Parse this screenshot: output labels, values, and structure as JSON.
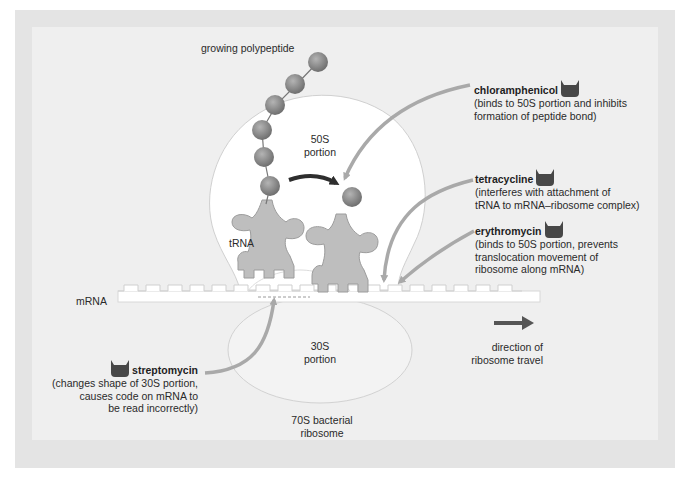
{
  "colors": {
    "frame_outer": "#e4e4e4",
    "frame_inner": "#efefef",
    "ribosome_fill": "#ffffff",
    "ribosome_outline": "#cfcfcf",
    "trna_fill": "#bdbdbd",
    "bead_fill": "#8a8a8a",
    "pointer_arrow": "#a9a9a9",
    "curved_arrow": "#2e2e2e",
    "direction_arrow": "#555555",
    "drug_icon": "#474747"
  },
  "labels": {
    "growing_polypeptide": "growing polypeptide",
    "portion_50s_line1": "50S",
    "portion_50s_line2": "portion",
    "trna": "tRNA",
    "mrna": "mRNA",
    "portion_30s_line1": "30S",
    "portion_30s_line2": "portion",
    "ribosome_line1": "70S bacterial",
    "ribosome_line2": "ribosome",
    "direction_line1": "direction of",
    "direction_line2": "ribosome travel"
  },
  "antibiotics": [
    {
      "name": "chloramphenicol",
      "icon": "antibiotic-cup-icon",
      "desc_line1": "(binds to 50S portion and inhibits",
      "desc_line2": "formation of peptide bond)"
    },
    {
      "name": "tetracycline",
      "icon": "antibiotic-cup-icon",
      "desc_line1": "(interferes with attachment of",
      "desc_line2": "tRNA to mRNA–ribosome complex)"
    },
    {
      "name": "erythromycin",
      "icon": "antibiotic-cup-icon",
      "desc_line1": "(binds to 50S portion, prevents",
      "desc_line2": "translocation movement of",
      "desc_line3": "ribosome along mRNA)"
    },
    {
      "name": "streptomycin",
      "icon": "antibiotic-cup-icon",
      "desc_line1": "(changes shape of 30S portion,",
      "desc_line2": "causes code on mRNA to",
      "desc_line3": "be read incorrectly)"
    }
  ]
}
